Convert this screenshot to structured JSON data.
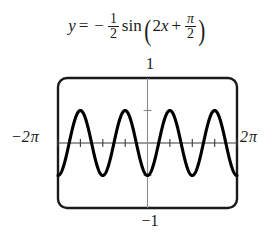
{
  "figure": {
    "kind": "trigonometric-function-graph",
    "equation": {
      "lhs": "y",
      "equals": "=",
      "minus": "−",
      "coef_num": "1",
      "coef_den": "2",
      "func": "sin",
      "paren_open": "(",
      "arg_coef": "2",
      "arg_var": "x",
      "arg_plus": "+",
      "arg_num": "π",
      "arg_den": "2",
      "paren_close": ")",
      "plain": "y = −1/2 sin(2x + π/2)"
    },
    "labels": {
      "y_max": "1",
      "y_min": "−1",
      "x_min_sign": "−2",
      "x_min_pi": "π",
      "x_max_num": "2",
      "x_max_pi": "π"
    }
  },
  "chart_data": {
    "type": "line",
    "xlabel": "",
    "ylabel": "",
    "xlim": [
      -6.283185307,
      6.283185307
    ],
    "ylim": [
      -1,
      1
    ],
    "xtick_labels": [
      "−2π",
      "2π"
    ],
    "ytick_labels": [
      "1",
      "−1"
    ],
    "xticks": [
      -6.283185307,
      -5.497787144,
      -4.71238898,
      -3.926990817,
      -3.141592654,
      -2.35619449,
      -1.570796327,
      -0.785398163,
      0,
      0.785398163,
      1.570796327,
      2.35619449,
      3.141592654,
      3.926990817,
      4.71238898,
      5.497787144,
      6.283185307
    ],
    "yticks": [
      -1,
      -0.5,
      0,
      0.5,
      1
    ],
    "grid": false,
    "legend": false,
    "amplitude": 0.5,
    "period": 3.141592654,
    "phase_shift": -0.785398163,
    "vertical_shift": 0,
    "reflected": true,
    "simplified_form": "y = −(1/2)cos(2x)",
    "cycles_shown": 4,
    "series": [
      {
        "name": "y = −1/2 sin(2x + π/2)",
        "color": "#000000",
        "key_points": [
          {
            "x": -6.283185307,
            "y": -0.5,
            "kind": "minimum"
          },
          {
            "x": -5.497787144,
            "y": 0.0,
            "kind": "zero"
          },
          {
            "x": -4.71238898,
            "y": 0.5,
            "kind": "maximum"
          },
          {
            "x": -3.926990817,
            "y": 0.0,
            "kind": "zero"
          },
          {
            "x": -3.141592654,
            "y": -0.5,
            "kind": "minimum"
          },
          {
            "x": -2.35619449,
            "y": 0.0,
            "kind": "zero"
          },
          {
            "x": -1.570796327,
            "y": 0.5,
            "kind": "maximum"
          },
          {
            "x": -0.785398163,
            "y": 0.0,
            "kind": "zero"
          },
          {
            "x": 0,
            "y": -0.5,
            "kind": "minimum"
          },
          {
            "x": 0.785398163,
            "y": 0.0,
            "kind": "zero"
          },
          {
            "x": 1.570796327,
            "y": 0.5,
            "kind": "maximum"
          },
          {
            "x": 2.35619449,
            "y": 0.0,
            "kind": "zero"
          },
          {
            "x": 3.141592654,
            "y": -0.5,
            "kind": "minimum"
          },
          {
            "x": 3.926990817,
            "y": 0.0,
            "kind": "zero"
          },
          {
            "x": 4.71238898,
            "y": 0.5,
            "kind": "maximum"
          },
          {
            "x": 5.497787144,
            "y": 0.0,
            "kind": "zero"
          },
          {
            "x": 6.283185307,
            "y": -0.5,
            "kind": "minimum"
          }
        ]
      }
    ]
  }
}
